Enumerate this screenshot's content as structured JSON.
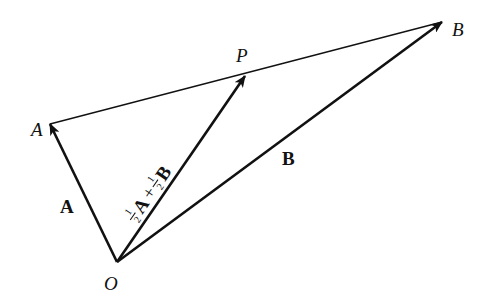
{
  "diagram": {
    "type": "vector-triangle",
    "points": {
      "O": {
        "label": "O",
        "x": 117,
        "y": 262
      },
      "A": {
        "label": "A",
        "x": 50,
        "y": 124
      },
      "P": {
        "label": "P",
        "x": 245,
        "y": 76
      },
      "B": {
        "label": "B",
        "x": 442,
        "y": 22
      }
    },
    "vectors": [
      {
        "from": "O",
        "to": "A",
        "label": "A"
      },
      {
        "from": "O",
        "to": "P",
        "label": "½A + ½B",
        "parts": {
          "coef1_num": "1",
          "coef1_den": "2",
          "vec1": "A",
          "plus": "+",
          "coef2_num": "1",
          "coef2_den": "2",
          "vec2": "B"
        }
      },
      {
        "from": "O",
        "to": "B",
        "label": "B"
      }
    ],
    "segments": [
      {
        "from": "A",
        "to": "B",
        "style": "thin"
      }
    ],
    "colors": {
      "stroke": "#111111",
      "background": "#ffffff"
    }
  }
}
